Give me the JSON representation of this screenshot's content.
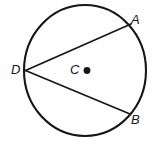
{
  "figure": {
    "type": "circle-inscribed-angle-diagram",
    "width": 152,
    "height": 144,
    "background_color": "#fefefe",
    "stroke_color": "#161616"
  },
  "labels": {
    "point_a": "A",
    "point_b": "B",
    "point_c": "C",
    "point_d": "D"
  },
  "geometry": {
    "circle": {
      "center_x": 85,
      "center_y": 70.5,
      "radius_x": 61,
      "radius_y": 65.5,
      "stroke_width": 2.1
    },
    "center_dot": {
      "cx": 87,
      "cy": 70.5,
      "r": 3.4
    },
    "points": {
      "A": {
        "x": 131,
        "y": 24
      },
      "B": {
        "x": 130,
        "y": 114
      },
      "C": {
        "x": 87,
        "y": 70.5
      },
      "D": {
        "x": 25.5,
        "y": 70.5
      }
    },
    "segments": [
      {
        "name": "chord-DA",
        "from": "D",
        "to": "A"
      },
      {
        "name": "chord-DB",
        "from": "D",
        "to": "B"
      }
    ]
  }
}
